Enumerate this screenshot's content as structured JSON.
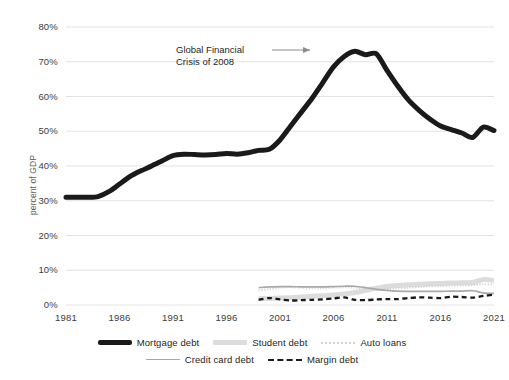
{
  "chart_data": {
    "type": "line",
    "title": "",
    "xlabel": "",
    "ylabel": "percent of GDP",
    "xlim": [
      1981,
      2021
    ],
    "ylim": [
      0,
      80
    ],
    "grid": true,
    "legend_position": "bottom",
    "x": [
      1981,
      1982,
      1983,
      1984,
      1985,
      1986,
      1987,
      1988,
      1989,
      1990,
      1991,
      1992,
      1993,
      1994,
      1995,
      1996,
      1997,
      1998,
      1999,
      2000,
      2001,
      2002,
      2003,
      2004,
      2005,
      2006,
      2007,
      2008,
      2009,
      2010,
      2011,
      2012,
      2013,
      2014,
      2015,
      2016,
      2017,
      2018,
      2019,
      2020,
      2021
    ],
    "ytick_labels": [
      "80%",
      "70%",
      "60%",
      "50%",
      "40%",
      "30%",
      "20%",
      "10%",
      "0%"
    ],
    "ytick_values": [
      80,
      70,
      60,
      50,
      40,
      30,
      20,
      10,
      0
    ],
    "xtick_labels": [
      "1981",
      "1986",
      "1991",
      "1996",
      "2001",
      "2006",
      "2011",
      "2016",
      "2021"
    ],
    "xtick_values": [
      1981,
      1986,
      1991,
      1996,
      2001,
      2006,
      2011,
      2016,
      2021
    ],
    "annotations": [
      {
        "text_line1": "Global Financial",
        "text_line2": "Crisis of 2008",
        "arrow": "right-arrow"
      }
    ],
    "series": [
      {
        "name": "Mortgage debt",
        "style": "thick-solid-black",
        "color": "#1a1a1a",
        "x": [
          1981,
          1982,
          1983,
          1984,
          1985,
          1986,
          1987,
          1988,
          1989,
          1990,
          1991,
          1992,
          1993,
          1994,
          1995,
          1996,
          1997,
          1998,
          1999,
          2000,
          2001,
          2002,
          2003,
          2004,
          2005,
          2006,
          2007,
          2008,
          2009,
          2010,
          2011,
          2012,
          2013,
          2014,
          2015,
          2016,
          2017,
          2018,
          2019,
          2020,
          2021
        ],
        "values": [
          31.0,
          31.0,
          31.0,
          31.2,
          32.6,
          34.8,
          37.0,
          38.6,
          40.0,
          41.5,
          43.0,
          43.4,
          43.3,
          43.2,
          43.3,
          43.6,
          43.4,
          43.8,
          44.5,
          44.8,
          47.5,
          51.5,
          55.5,
          59.5,
          64.0,
          68.5,
          71.5,
          73.0,
          72.0,
          72.3,
          67.5,
          63.0,
          59.0,
          56.0,
          53.5,
          51.5,
          50.5,
          49.5,
          48.2,
          51.2,
          50.2
        ]
      },
      {
        "name": "Student debt",
        "style": "thick-solid-lightgray",
        "color": "#dcdcdc",
        "x": [
          1999,
          2000,
          2001,
          2002,
          2003,
          2004,
          2005,
          2006,
          2007,
          2008,
          2009,
          2010,
          2011,
          2012,
          2013,
          2014,
          2015,
          2016,
          2017,
          2018,
          2019,
          2020,
          2021
        ],
        "values": [
          1.8,
          1.9,
          2.0,
          2.1,
          2.3,
          2.5,
          2.7,
          2.9,
          3.2,
          3.6,
          4.2,
          4.8,
          5.3,
          5.6,
          5.8,
          6.0,
          6.1,
          6.2,
          6.3,
          6.4,
          6.5,
          7.3,
          7.1
        ]
      },
      {
        "name": "Auto loans",
        "style": "dotted-lightgray",
        "color": "#d2d2d2",
        "x": [
          1999,
          2000,
          2001,
          2002,
          2003,
          2004,
          2005,
          2006,
          2007,
          2008,
          2009,
          2010,
          2011,
          2012,
          2013,
          2014,
          2015,
          2016,
          2017,
          2018,
          2019,
          2020,
          2021
        ],
        "values": [
          4.2,
          4.6,
          5.0,
          5.1,
          5.0,
          4.9,
          4.9,
          5.0,
          5.1,
          5.0,
          4.7,
          4.5,
          4.6,
          4.8,
          5.0,
          5.2,
          5.4,
          5.5,
          5.6,
          5.6,
          5.7,
          6.0,
          5.9
        ]
      },
      {
        "name": "Credit card debt",
        "style": "thin-solid-gray",
        "color": "#a9a9a9",
        "x": [
          1999,
          2000,
          2001,
          2002,
          2003,
          2004,
          2005,
          2006,
          2007,
          2008,
          2009,
          2010,
          2011,
          2012,
          2013,
          2014,
          2015,
          2016,
          2017,
          2018,
          2019,
          2020,
          2021
        ],
        "values": [
          5.0,
          5.2,
          5.3,
          5.3,
          5.2,
          5.2,
          5.2,
          5.3,
          5.4,
          5.4,
          5.0,
          4.5,
          4.2,
          4.0,
          3.9,
          3.9,
          3.9,
          3.9,
          4.0,
          4.0,
          4.1,
          3.5,
          3.3
        ]
      },
      {
        "name": "Margin debt",
        "style": "dashed-black",
        "color": "#1a1a1a",
        "x": [
          1999,
          2000,
          2001,
          2002,
          2003,
          2004,
          2005,
          2006,
          2007,
          2008,
          2009,
          2010,
          2011,
          2012,
          2013,
          2014,
          2015,
          2016,
          2017,
          2018,
          2019,
          2020,
          2021
        ],
        "values": [
          1.5,
          2.0,
          1.6,
          1.3,
          1.4,
          1.5,
          1.6,
          1.9,
          2.2,
          1.5,
          1.4,
          1.6,
          1.7,
          1.7,
          2.0,
          2.2,
          2.1,
          2.0,
          2.4,
          2.3,
          2.1,
          2.6,
          3.0
        ]
      }
    ]
  },
  "legend": {
    "row1": [
      {
        "label": "Mortgage debt",
        "swatch": "thick-black"
      },
      {
        "label": "Student debt",
        "swatch": "thick-gray"
      },
      {
        "label": "Auto loans",
        "swatch": "dotted"
      }
    ],
    "row2": [
      {
        "label": "Credit card debt",
        "swatch": "thin-gray"
      },
      {
        "label": "Margin debt",
        "swatch": "dashed"
      }
    ]
  },
  "colors": {
    "mortgage": "#1a1a1a",
    "student": "#dcdcdc",
    "auto": "#d2d2d2",
    "credit_card": "#a9a9a9",
    "margin": "#1a1a1a",
    "gridline": "#e3e3e3",
    "text": "#231f20"
  }
}
